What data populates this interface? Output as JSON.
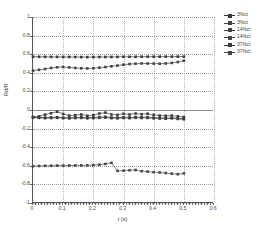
{
  "chart_data": {
    "type": "line",
    "title": "",
    "xlabel": "t (s)",
    "ylabel": "Rd/R",
    "xlim": [
      0,
      0.6
    ],
    "ylim": [
      -1,
      1
    ],
    "xticks": [
      "0",
      "0.1",
      "0.2",
      "0.3",
      "0.4",
      "0.5",
      "0.6"
    ],
    "xtick_values": [
      0,
      0.1,
      0.2,
      0.3,
      0.4,
      0.5,
      0.6
    ],
    "yticks": [
      "1",
      "0.8",
      "0.6",
      "0.4",
      "0.2",
      "0",
      "-0.2",
      "-0.4",
      "-0.6",
      "-0.8",
      "-1"
    ],
    "ytick_values": [
      1,
      0.8,
      0.6,
      0.4,
      0.2,
      0,
      -0.2,
      -0.4,
      -0.6,
      -0.8,
      -1
    ],
    "grid": true,
    "legend_position": "right",
    "marker": "square",
    "series": [
      {
        "name": "3%ct",
        "color": "#3a3a3a",
        "x": [
          0.0,
          0.02,
          0.04,
          0.06,
          0.08,
          0.1,
          0.12,
          0.14,
          0.16,
          0.18,
          0.2,
          0.22,
          0.24,
          0.26,
          0.28,
          0.3,
          0.32,
          0.34,
          0.36,
          0.38,
          0.4,
          0.42,
          0.44,
          0.46,
          0.48,
          0.5
        ],
        "y": [
          0.573,
          0.572,
          0.572,
          0.571,
          0.571,
          0.57,
          0.57,
          0.57,
          0.569,
          0.569,
          0.569,
          0.57,
          0.57,
          0.571,
          0.571,
          0.572,
          0.572,
          0.572,
          0.573,
          0.573,
          0.573,
          0.573,
          0.574,
          0.574,
          0.574,
          0.574
        ]
      },
      {
        "name": "3%ct",
        "color": "#444444",
        "x": [
          0.0,
          0.02,
          0.04,
          0.06,
          0.08,
          0.1,
          0.12,
          0.14,
          0.16,
          0.18,
          0.2,
          0.22,
          0.24,
          0.26,
          0.28,
          0.3,
          0.32,
          0.34,
          0.36,
          0.38,
          0.4,
          0.42,
          0.44,
          0.46,
          0.48,
          0.5
        ],
        "y": [
          0.423,
          0.432,
          0.441,
          0.452,
          0.459,
          0.462,
          0.458,
          0.452,
          0.449,
          0.447,
          0.45,
          0.455,
          0.462,
          0.47,
          0.478,
          0.487,
          0.494,
          0.498,
          0.5,
          0.5,
          0.499,
          0.498,
          0.5,
          0.506,
          0.516,
          0.53
        ]
      },
      {
        "name": "14%ct",
        "color": "#3f3f3f",
        "x": [
          0.0,
          0.02,
          0.04,
          0.06,
          0.08,
          0.1,
          0.12,
          0.14,
          0.16,
          0.18,
          0.2,
          0.22,
          0.24,
          0.26,
          0.28,
          0.3,
          0.32,
          0.34,
          0.36,
          0.38,
          0.4,
          0.42,
          0.44,
          0.46,
          0.48,
          0.5
        ],
        "y": [
          -0.075,
          -0.068,
          -0.05,
          -0.035,
          -0.018,
          -0.042,
          -0.06,
          -0.055,
          -0.048,
          -0.062,
          -0.055,
          -0.038,
          -0.028,
          -0.048,
          -0.052,
          -0.04,
          -0.048,
          -0.038,
          -0.045,
          -0.04,
          -0.052,
          -0.06,
          -0.062,
          -0.06,
          -0.068,
          -0.075
        ]
      },
      {
        "name": "14%ct",
        "color": "#4a4a4a",
        "x": [
          0.0,
          0.02,
          0.04,
          0.06,
          0.08,
          0.1,
          0.12,
          0.14,
          0.16,
          0.18,
          0.2,
          0.22,
          0.24,
          0.26,
          0.28,
          0.3,
          0.32,
          0.34,
          0.36,
          0.38,
          0.4,
          0.42,
          0.44,
          0.46,
          0.48,
          0.5
        ],
        "y": [
          -0.082,
          -0.085,
          -0.088,
          -0.086,
          -0.084,
          -0.088,
          -0.09,
          -0.087,
          -0.085,
          -0.09,
          -0.088,
          -0.084,
          -0.082,
          -0.088,
          -0.09,
          -0.086,
          -0.088,
          -0.084,
          -0.086,
          -0.085,
          -0.09,
          -0.092,
          -0.094,
          -0.09,
          -0.096,
          -0.1
        ]
      },
      {
        "name": "37%ct",
        "color": "#3c3c3c",
        "x": [
          0.0,
          0.02,
          0.04,
          0.06,
          0.08,
          0.1,
          0.12,
          0.14,
          0.16,
          0.18,
          0.2,
          0.22,
          0.24,
          0.26,
          0.28,
          0.3,
          0.32,
          0.34,
          0.36,
          0.38,
          0.4,
          0.42,
          0.44,
          0.46,
          0.48,
          0.5
        ],
        "y": [
          -0.078,
          -0.08,
          -0.082,
          -0.08,
          -0.078,
          -0.082,
          -0.084,
          -0.08,
          -0.078,
          -0.083,
          -0.08,
          -0.076,
          -0.074,
          -0.08,
          -0.082,
          -0.078,
          -0.08,
          -0.076,
          -0.078,
          -0.077,
          -0.082,
          -0.085,
          -0.088,
          -0.084,
          -0.09,
          -0.094
        ]
      },
      {
        "name": "37%ct",
        "color": "#474747",
        "x": [
          0.0,
          0.02,
          0.04,
          0.06,
          0.08,
          0.1,
          0.12,
          0.14,
          0.16,
          0.18,
          0.2,
          0.22,
          0.24,
          0.26,
          0.28,
          0.3,
          0.32,
          0.34,
          0.36,
          0.38,
          0.4,
          0.42,
          0.44,
          0.46,
          0.48,
          0.5
        ],
        "y": [
          -0.605,
          -0.602,
          -0.6,
          -0.599,
          -0.598,
          -0.598,
          -0.597,
          -0.596,
          -0.596,
          -0.595,
          -0.593,
          -0.588,
          -0.58,
          -0.568,
          -0.655,
          -0.652,
          -0.648,
          -0.645,
          -0.658,
          -0.662,
          -0.668,
          -0.672,
          -0.678,
          -0.685,
          -0.69,
          -0.682
        ]
      }
    ],
    "legend": [
      {
        "label": "3%ct"
      },
      {
        "label": "3%ct"
      },
      {
        "label": "14%ct"
      },
      {
        "label": "14%ct"
      },
      {
        "label": "37%ct"
      },
      {
        "label": "37%ct"
      }
    ]
  }
}
